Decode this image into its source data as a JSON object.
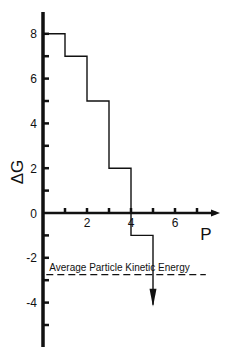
{
  "chart_data": {
    "type": "line",
    "subtype": "step",
    "title": "",
    "xlabel": "P",
    "ylabel": "ΔG",
    "xlim": [
      0,
      8
    ],
    "ylim": [
      -6,
      9
    ],
    "x_ticks": [
      1,
      2,
      3,
      4,
      5,
      6,
      7
    ],
    "x_tick_labels": [
      {
        "value": 2,
        "label": "2"
      },
      {
        "value": 4,
        "label": "4"
      },
      {
        "value": 6,
        "label": "6"
      }
    ],
    "y_ticks": [
      8,
      7,
      6,
      5,
      4,
      3,
      2,
      1,
      -1,
      -2,
      -3,
      -4,
      -5
    ],
    "y_tick_labels": [
      {
        "value": 8,
        "label": "8"
      },
      {
        "value": 6,
        "label": "6"
      },
      {
        "value": 4,
        "label": "4"
      },
      {
        "value": 2,
        "label": "2"
      },
      {
        "value": 0,
        "label": "0"
      },
      {
        "value": -2,
        "label": "-2"
      },
      {
        "value": -4,
        "label": "-4"
      }
    ],
    "grid": false,
    "series": [
      {
        "name": "ΔG steps",
        "x": [
          0,
          1,
          1,
          2,
          2,
          3,
          3,
          4,
          4,
          5,
          5
        ],
        "y": [
          8,
          8,
          7,
          7,
          5,
          5,
          2,
          2,
          -1,
          -1,
          -4.1
        ],
        "ends_with_arrow": true
      }
    ],
    "annotations": [
      {
        "type": "hline",
        "style": "dashed",
        "y": -2.75,
        "x_range": [
          0.15,
          7.4
        ],
        "label": "Average Particle Kinetic Energy"
      }
    ]
  },
  "colors": {
    "ink": "#111111",
    "background": "#ffffff"
  }
}
